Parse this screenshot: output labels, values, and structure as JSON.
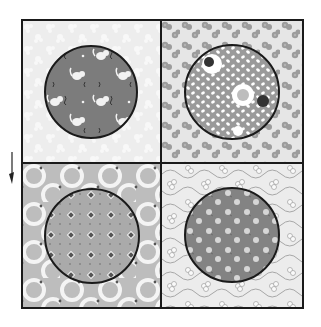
{
  "figure": {
    "grid": {
      "left": 22,
      "top": 20,
      "right": 303,
      "bottom": 308,
      "divider_x": 161,
      "divider_y": 163
    },
    "colors": {
      "border": "#1a1a1a",
      "paper": "#ffffff",
      "arrow": "#222222"
    },
    "direction_arrow": {
      "icon": "arrow-down-icon",
      "x": 12,
      "y1": 152,
      "y2": 182
    },
    "blocks": [
      {
        "id": "top-left",
        "background": {
          "name": "white-on-white floral",
          "color": "#ededed",
          "motif_color": "#f7f7f7"
        },
        "circle": {
          "cx": 91,
          "cy": 92,
          "r": 46,
          "name": "kittens print",
          "color": "#7c7c7c",
          "motif_color": "#f2f2f2",
          "accent_color": "#3a3a3a"
        }
      },
      {
        "id": "top-right",
        "background": {
          "name": "grey flower clusters",
          "color": "#e6e6e6",
          "motif_color": "#9c9c9c"
        },
        "circle": {
          "cx": 232,
          "cy": 92,
          "r": 47,
          "name": "white leaves with fruit",
          "color": "#9a9a9a",
          "motif_color": "#ffffff",
          "accent_color": "#333333"
        }
      },
      {
        "id": "bottom-left",
        "background": {
          "name": "dotted rings",
          "color": "#bdbdbd",
          "motif_color": "#f4f4f4",
          "accent_color": "#555555"
        },
        "circle": {
          "cx": 92,
          "cy": 236,
          "r": 47,
          "name": "diamonds and dots",
          "color": "#aaaaaa",
          "motif_color": "#555555",
          "accent_color": "#f0f0f0"
        }
      },
      {
        "id": "bottom-right",
        "background": {
          "name": "outline flowers and vines",
          "color": "#ececec",
          "motif_color": "#9e9e9e"
        },
        "circle": {
          "cx": 232,
          "cy": 235,
          "r": 47,
          "name": "light polka flowers",
          "color": "#838383",
          "motif_color": "#d6d6d6"
        }
      }
    ]
  }
}
